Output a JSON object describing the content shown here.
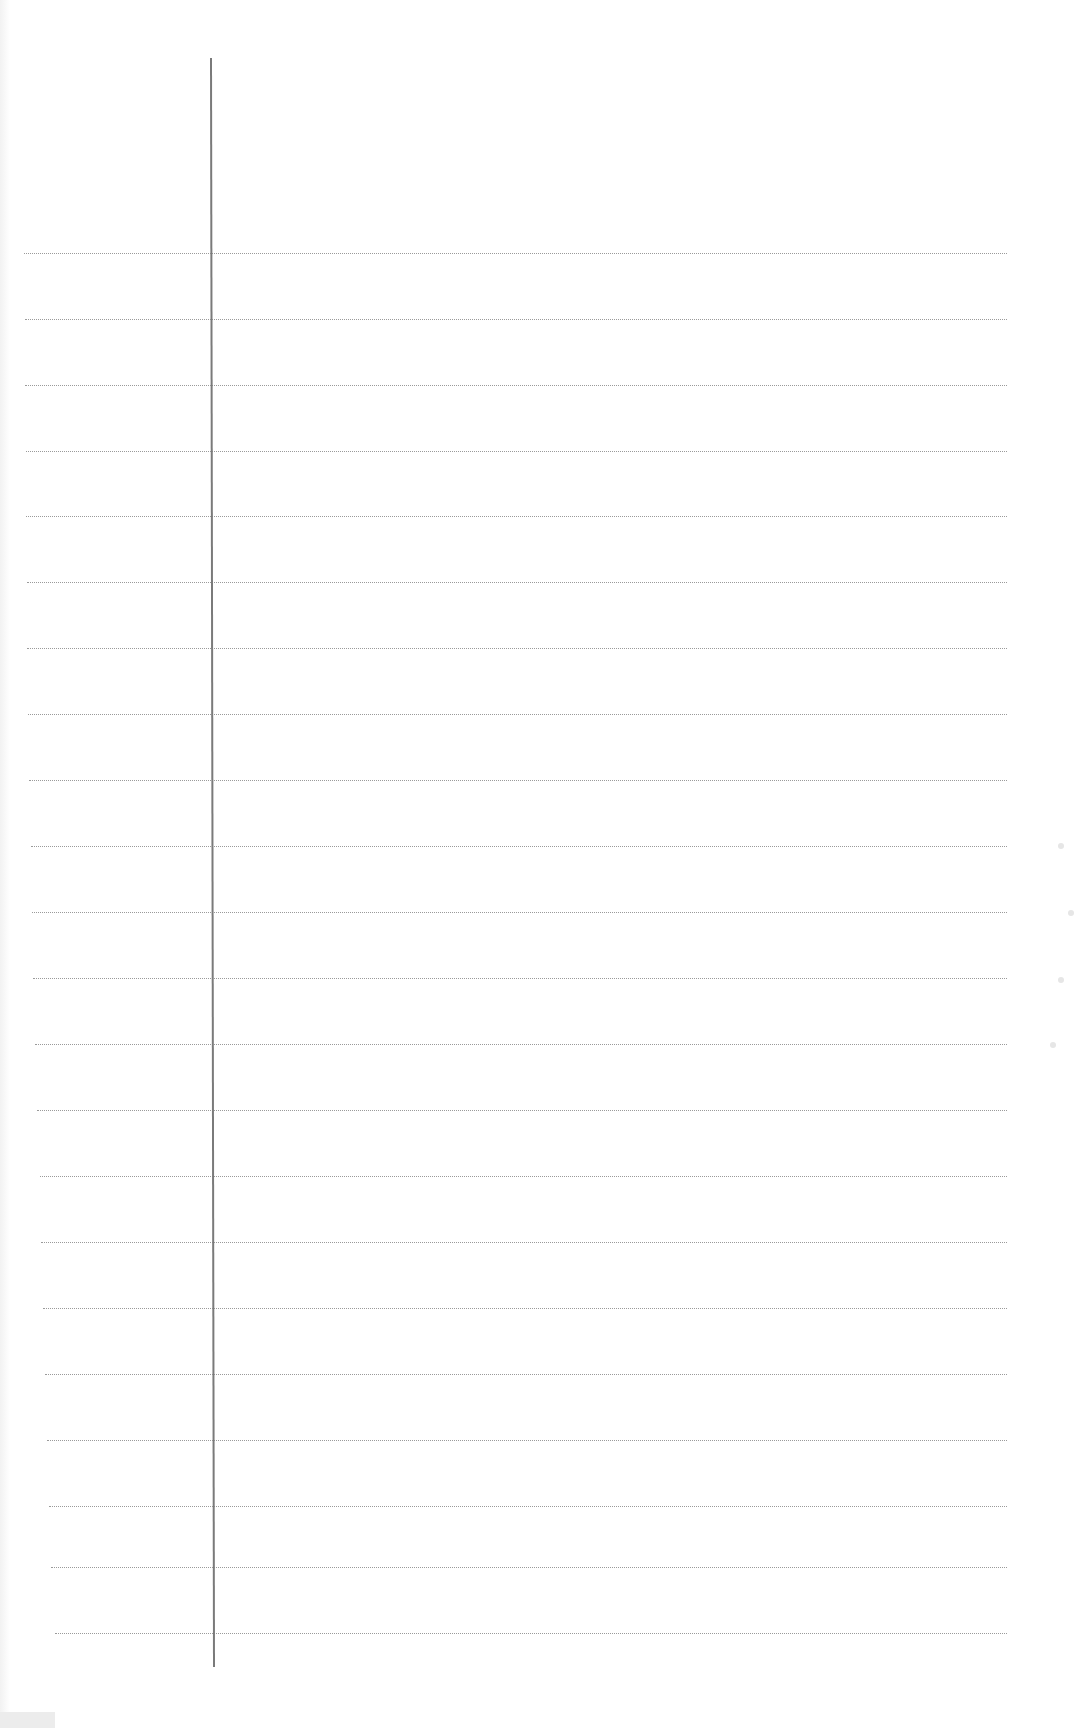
{
  "page": {
    "type": "blank lined notebook page",
    "width": 1076,
    "height": 1728,
    "background_color": "#ffffff"
  },
  "margin_line": {
    "x_top": 210,
    "y_top": 58,
    "x_bottom": 213,
    "y_bottom": 1667,
    "color": "#7a7a7a"
  },
  "rules": {
    "color": "#9a9a9a",
    "right_x": 1007,
    "lines": [
      {
        "y": 253,
        "left": 24
      },
      {
        "y": 319,
        "left": 25
      },
      {
        "y": 385,
        "left": 25
      },
      {
        "y": 451,
        "left": 26
      },
      {
        "y": 516,
        "left": 26
      },
      {
        "y": 582,
        "left": 27
      },
      {
        "y": 648,
        "left": 27
      },
      {
        "y": 714,
        "left": 28
      },
      {
        "y": 780,
        "left": 29
      },
      {
        "y": 846,
        "left": 31
      },
      {
        "y": 912,
        "left": 32
      },
      {
        "y": 978,
        "left": 33
      },
      {
        "y": 1044,
        "left": 35
      },
      {
        "y": 1110,
        "left": 37
      },
      {
        "y": 1176,
        "left": 40
      },
      {
        "y": 1242,
        "left": 41
      },
      {
        "y": 1308,
        "left": 43
      },
      {
        "y": 1374,
        "left": 45
      },
      {
        "y": 1440,
        "left": 47
      },
      {
        "y": 1506,
        "left": 49
      },
      {
        "y": 1567,
        "left": 51
      },
      {
        "y": 1633,
        "left": 55
      }
    ]
  },
  "scan_marks": [
    {
      "x": 1058,
      "y": 843
    },
    {
      "x": 1068,
      "y": 910
    },
    {
      "x": 1058,
      "y": 977
    },
    {
      "x": 1050,
      "y": 1042
    }
  ]
}
